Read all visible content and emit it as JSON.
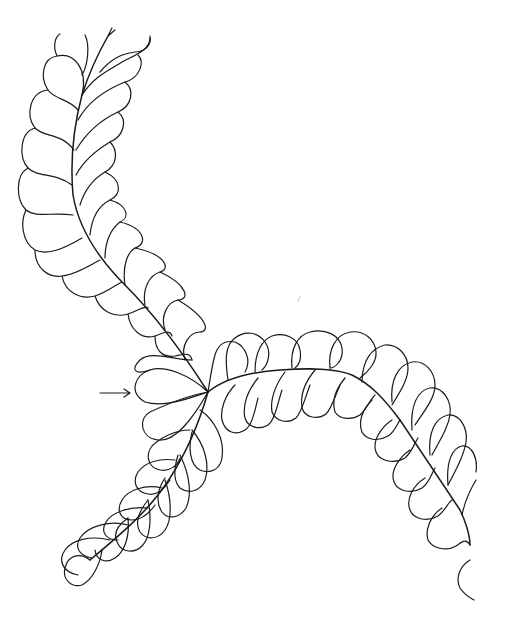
{
  "figure": {
    "background": "#ffffff",
    "stroke_color": "#1a1a1a",
    "elements": [
      {
        "name": "upper-feather",
        "direction": "top to center junction"
      },
      {
        "name": "right-feather",
        "direction": "junction arcing right then down"
      },
      {
        "name": "lower-feather",
        "direction": "junction to lower-left"
      },
      {
        "name": "heart-junction",
        "note": "heart-shaped plumes at center junction"
      },
      {
        "name": "direction-arrow",
        "glyph": "→",
        "note": "arrow pointing at junction"
      }
    ]
  }
}
